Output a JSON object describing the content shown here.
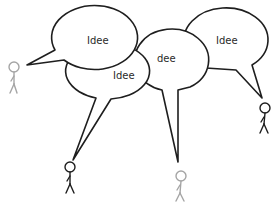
{
  "diagram": {
    "title": "",
    "bubbles": [
      {
        "id": "bubble-1",
        "label": "Idee",
        "speaker": "figure-1"
      },
      {
        "id": "bubble-2",
        "label": "Idee",
        "speaker": "figure-2"
      },
      {
        "id": "bubble-3",
        "label": "dee",
        "speaker": "figure-3"
      },
      {
        "id": "bubble-4",
        "label": "Idee",
        "speaker": "figure-4"
      }
    ],
    "figures": [
      {
        "id": "figure-1",
        "color": "#a5a5a5"
      },
      {
        "id": "figure-2",
        "color": "#1e1e1e"
      },
      {
        "id": "figure-3",
        "color": "#a5a5a5"
      },
      {
        "id": "figure-4",
        "color": "#1e1e1e"
      }
    ],
    "colors": {
      "outline": "#1e1e1e",
      "inactive_figure": "#a5a5a5",
      "background": "#ffffff"
    }
  }
}
